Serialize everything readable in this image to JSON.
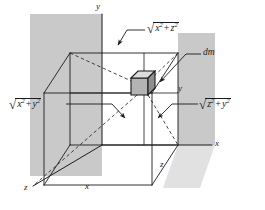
{
  "figure": {
    "type": "technical-diagram",
    "background_color": "#ffffff",
    "line_color": "#1b1b1b",
    "plane_shade_color": "#c9c9c9",
    "dm_cube_face_color": "#b0b0b0"
  },
  "axes": {
    "y_top": "y",
    "x_right": "x",
    "z_bottom_left": "z",
    "x_bottom": "x",
    "z_bottom_right": "z",
    "y_inner": "y"
  },
  "labels": {
    "dm": "dm",
    "top_radical": {
      "radical_symbol": "√",
      "term1_base": "x",
      "term1_exp": "2",
      "operator": "+",
      "term2_base": "z",
      "term2_exp": "2",
      "plain": "√(x² + z²)"
    },
    "left_radical": {
      "radical_symbol": "√",
      "term1_base": "x",
      "term1_exp": "2",
      "operator": "+",
      "term2_base": "y",
      "term2_exp": "2",
      "plain": "√(x² + y²)"
    },
    "right_radical": {
      "radical_symbol": "√",
      "term1_base": "z",
      "term1_exp": "2",
      "operator": "+",
      "term2_base": "y",
      "term2_exp": "2",
      "plain": "√(z² + y²)"
    }
  }
}
